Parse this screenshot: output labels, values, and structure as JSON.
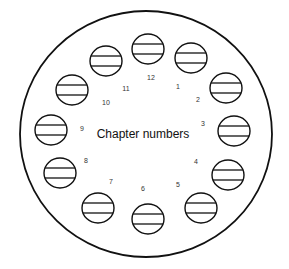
{
  "diagram": {
    "center_label": "Chapter numbers",
    "outer_boundary": {
      "cx": 146,
      "cy": 134,
      "rx": 126,
      "ry": 123
    },
    "stroke_color": "#111111",
    "chapters": [
      {
        "label": "12",
        "cx": 148,
        "cy": 49,
        "lx": 151,
        "ly": 80
      },
      {
        "label": "1",
        "cx": 191,
        "cy": 58,
        "lx": 178,
        "ly": 89
      },
      {
        "label": "2",
        "cx": 226,
        "cy": 88,
        "lx": 198,
        "ly": 102
      },
      {
        "label": "3",
        "cx": 234,
        "cy": 131,
        "lx": 203,
        "ly": 126
      },
      {
        "label": "4",
        "cx": 228,
        "cy": 175,
        "lx": 196,
        "ly": 164
      },
      {
        "label": "5",
        "cx": 201,
        "cy": 208,
        "lx": 178,
        "ly": 187
      },
      {
        "label": "6",
        "cx": 148,
        "cy": 219,
        "lx": 143,
        "ly": 191
      },
      {
        "label": "7",
        "cx": 98,
        "cy": 208,
        "lx": 111,
        "ly": 184
      },
      {
        "label": "8",
        "cx": 60,
        "cy": 173,
        "lx": 86,
        "ly": 163
      },
      {
        "label": "9",
        "cx": 51,
        "cy": 130,
        "lx": 82,
        "ly": 131
      },
      {
        "label": "10",
        "cx": 72,
        "cy": 90,
        "lx": 106,
        "ly": 105
      },
      {
        "label": "11",
        "cx": 106,
        "cy": 61,
        "lx": 126,
        "ly": 91
      }
    ]
  }
}
